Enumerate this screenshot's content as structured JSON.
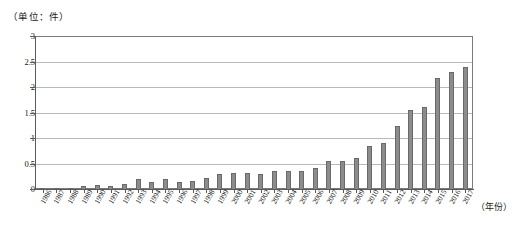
{
  "chart_data": {
    "type": "bar",
    "title": "",
    "subtitle": "",
    "unit_label": "（单位：件）",
    "xlabel": "（年份）",
    "ylabel": "",
    "ylim": [
      0,
      3
    ],
    "ytick_labels": [
      "0",
      "0.5",
      "1",
      "1.5",
      "2",
      "2.5",
      "3"
    ],
    "ytick_values": [
      0,
      0.5,
      1,
      1.5,
      2,
      2.5,
      3
    ],
    "grid": true,
    "legend": "none",
    "bar_color": "#8c8c8c",
    "bar_edge_color": "#6a6a6a",
    "gridline_color": "#b9b9b9",
    "axis_color": "#5a5a5a",
    "categories": [
      "1986",
      "1987",
      "1988",
      "1989",
      "1990",
      "1991",
      "1992",
      "1993",
      "1994",
      "1995",
      "1996",
      "1997",
      "1998",
      "1999",
      "2000",
      "2001",
      "2002",
      "2003",
      "2004",
      "2005",
      "2006",
      "2007",
      "2008",
      "2009",
      "2010",
      "2011",
      "2012",
      "2013",
      "2014",
      "2015",
      "2016",
      "2017"
    ],
    "values": [
      0.01,
      0.02,
      0.02,
      0.05,
      0.07,
      0.05,
      0.1,
      0.2,
      0.14,
      0.19,
      0.14,
      0.16,
      0.22,
      0.3,
      0.32,
      0.31,
      0.29,
      0.35,
      0.35,
      0.35,
      0.42,
      0.55,
      0.55,
      0.61,
      0.85,
      0.91,
      1.25,
      1.55,
      1.61,
      2.2,
      2.3,
      2.41
    ]
  }
}
